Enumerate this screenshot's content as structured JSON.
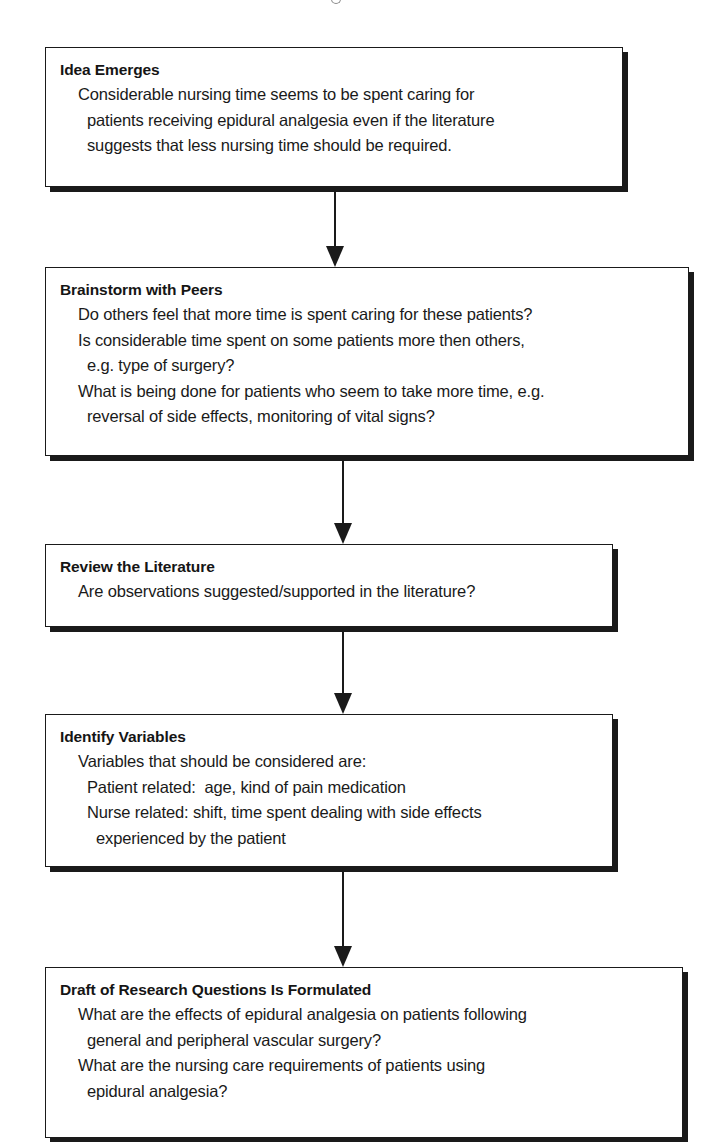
{
  "flowchart": {
    "steps": [
      {
        "heading": "Idea Emerges",
        "lines": [
          {
            "text": "Considerable nursing time seems to be spent caring for",
            "indent": 1
          },
          {
            "text": "patients receiving epidural analgesia even if the literature",
            "indent": 2
          },
          {
            "text": "suggests that less nursing time should be required.",
            "indent": 2
          }
        ]
      },
      {
        "heading": "Brainstorm with Peers",
        "lines": [
          {
            "text": "Do others feel that more time is spent caring for these patients?",
            "indent": 1
          },
          {
            "text": "Is considerable time spent on some patients more then others,",
            "indent": 1
          },
          {
            "text": "e.g. type of surgery?",
            "indent": 2
          },
          {
            "text": "What is being done for patients who seem to take more time, e.g.",
            "indent": 1
          },
          {
            "text": "reversal of side effects, monitoring of vital signs?",
            "indent": 2
          }
        ]
      },
      {
        "heading": "Review the Literature",
        "lines": [
          {
            "text": "Are observations suggested/supported in the literature?",
            "indent": 1
          }
        ]
      },
      {
        "heading": "Identify Variables",
        "lines": [
          {
            "text": "Variables that should be considered are:",
            "indent": 1
          },
          {
            "text": "Patient related:  age, kind of pain medication",
            "indent": 2
          },
          {
            "text": "Nurse related: shift, time spent dealing with side effects",
            "indent": 2
          },
          {
            "text": "experienced by the patient",
            "indent": 3
          }
        ]
      },
      {
        "heading": "Draft of Research Questions Is Formulated",
        "lines": [
          {
            "text": "What are the effects of epidural analgesia on patients following",
            "indent": 1
          },
          {
            "text": "general and peripheral vascular surgery?",
            "indent": 2
          },
          {
            "text": "What are the nursing care requirements of patients using",
            "indent": 1
          },
          {
            "text": "epidural analgesia?",
            "indent": 2
          }
        ]
      }
    ],
    "connectors": [
      {
        "from": 0,
        "to": 1,
        "type": "arrow-down"
      },
      {
        "from": 1,
        "to": 2,
        "type": "arrow-down"
      },
      {
        "from": 2,
        "to": 3,
        "type": "arrow-down"
      },
      {
        "from": 3,
        "to": 4,
        "type": "arrow-down"
      }
    ],
    "colors": {
      "ink": "#1a1a1a",
      "background": "#ffffff"
    }
  }
}
